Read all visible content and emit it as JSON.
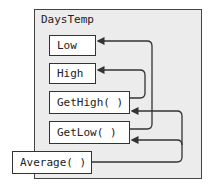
{
  "diagram": {
    "container": {
      "label": "DaysTemp"
    },
    "members": [
      {
        "id": "low",
        "label": "Low"
      },
      {
        "id": "high",
        "label": "High"
      },
      {
        "id": "gethigh",
        "label": "GetHigh( )"
      },
      {
        "id": "getlow",
        "label": "GetLow( )"
      }
    ],
    "external": {
      "id": "average",
      "label": "Average( )"
    },
    "edges": [
      {
        "from": "GetHigh( )",
        "to": "High"
      },
      {
        "from": "GetLow( )",
        "to": "Low"
      },
      {
        "from": "Average( )",
        "to": "GetHigh( )"
      },
      {
        "from": "Average( )",
        "to": "GetLow( )"
      }
    ]
  }
}
